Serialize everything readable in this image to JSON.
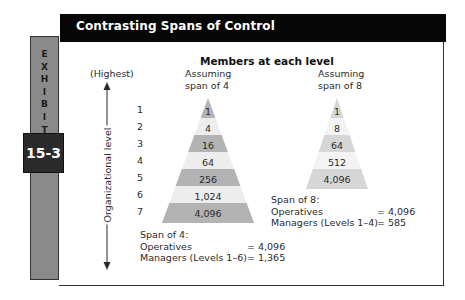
{
  "header": {
    "title": "Contrasting Spans of Control"
  },
  "exhibit": {
    "letters": [
      "E",
      "X",
      "H",
      "I",
      "B",
      "I",
      "T"
    ],
    "number": "15-3"
  },
  "chart": {
    "title": "Members at each level",
    "axis": {
      "top_label": "(Highest)",
      "label": "Organizational level"
    },
    "levels": [
      "1",
      "2",
      "3",
      "4",
      "5",
      "6",
      "7"
    ],
    "span4": {
      "heading_line1": "Assuming",
      "heading_line2": "span of 4",
      "values": [
        "1",
        "4",
        "16",
        "64",
        "256",
        "1,024",
        "4,096"
      ],
      "summary": {
        "title": "Span of 4:",
        "operatives_label": "Operatives",
        "operatives_value": "= 4,096",
        "managers_label": "Managers (Levels 1–6)",
        "managers_value": "= 1,365"
      }
    },
    "span8": {
      "heading_line1": "Assuming",
      "heading_line2": "span of 8",
      "values": [
        "1",
        "8",
        "64",
        "512",
        "4,096"
      ],
      "summary": {
        "title": "Span of 8:",
        "operatives_label": "Operatives",
        "operatives_value": "= 4,096",
        "managers_label": "Managers (Levels 1–4)",
        "managers_value": "= 585"
      }
    }
  },
  "colors": {
    "header_bg": "#060606",
    "tab_bg": "#8a8a8a",
    "number_bg": "#2b2b2b",
    "band_dark_4": "#b3b3b3",
    "band_light_4": "#ededed",
    "band_dark_8": "#d6d6d6",
    "band_light_8": "#f3f3f3"
  }
}
